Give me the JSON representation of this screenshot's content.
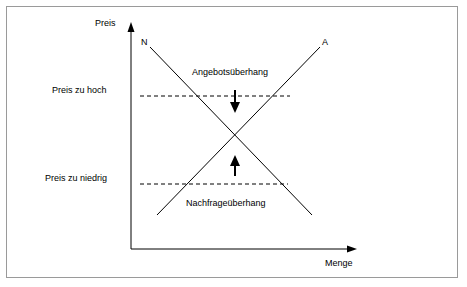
{
  "diagram": {
    "type": "supply-demand",
    "axes": {
      "y_label": "Preis",
      "x_label": "Menge"
    },
    "curves": [
      {
        "id": "demand",
        "label": "N",
        "description": "Nachfragekurve, fallend von links oben nach rechts unten"
      },
      {
        "id": "supply",
        "label": "A",
        "description": "Angebotskurve, steigend von links unten nach rechts oben"
      }
    ],
    "gridlines": [
      {
        "id": "price-too-high",
        "label": "Preis zu hoch"
      },
      {
        "id": "price-too-low",
        "label": "Preis zu niedrig"
      }
    ],
    "annotations": [
      {
        "id": "excess-supply",
        "label": "Angebotsüberhang",
        "arrow": "down"
      },
      {
        "id": "excess-demand",
        "label": "Nachfrageüberhang",
        "arrow": "up"
      }
    ]
  }
}
